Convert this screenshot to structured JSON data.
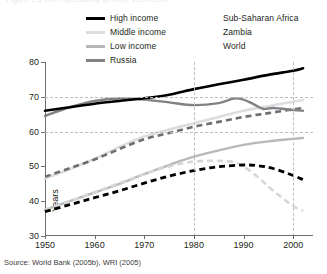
{
  "figure": {
    "top_fragment": "Figure 2.3  Life expectancy at birth, 1950-2002",
    "source_note": "Source: World Bank (2005b), WRI (2005)"
  },
  "legend": {
    "left_column": [
      {
        "label": "High income",
        "color": "#000000",
        "style": "solid",
        "width": 3
      },
      {
        "label": "Middle income",
        "color": "#dcdddf",
        "style": "solid",
        "width": 3
      },
      {
        "label": "Low income",
        "color": "#b6b8ba",
        "style": "solid",
        "width": 3
      },
      {
        "label": "Russia",
        "color": "#808285",
        "style": "solid",
        "width": 3
      }
    ],
    "right_column": [
      {
        "label": "Sub-Saharan Africa",
        "color": "#000000",
        "style": "dashed",
        "width": 3
      },
      {
        "label": "Zambia",
        "color": "#d5d6d8",
        "style": "dashed",
        "width": 3
      },
      {
        "label": "World",
        "color": "#6d6e71",
        "style": "dashed",
        "width": 3
      }
    ]
  },
  "chart_data": {
    "type": "line",
    "title": "",
    "xlabel": "",
    "ylabel": "Years",
    "xlim": [
      1950,
      2004
    ],
    "ylim": [
      30,
      80
    ],
    "xticks": [
      1950,
      1960,
      1970,
      1980,
      1990,
      2000
    ],
    "yticks": [
      30,
      40,
      50,
      60,
      70,
      80
    ],
    "xtick_labels": [
      "1950",
      "1960",
      "1970",
      "1980",
      "1990",
      "2000"
    ],
    "ytick_labels": [
      "30",
      "40",
      "50",
      "60",
      "70",
      "80"
    ],
    "grid": {
      "horizontal_at": [
        60,
        70
      ],
      "vertical_at": [
        1980,
        2000
      ],
      "style": "dashed"
    },
    "legend_position": "above-plot",
    "series": [
      {
        "name": "High income",
        "color": "#000000",
        "style": "solid",
        "width": 2.6,
        "x": [
          1950,
          1955,
          1960,
          1965,
          1970,
          1975,
          1980,
          1985,
          1990,
          1995,
          2000,
          2002
        ],
        "values": [
          66.0,
          67.0,
          68.0,
          68.8,
          69.6,
          70.6,
          72.2,
          73.6,
          74.9,
          76.3,
          77.5,
          78.2
        ]
      },
      {
        "name": "Russia",
        "color": "#808285",
        "style": "solid",
        "width": 2.4,
        "x": [
          1950,
          1955,
          1960,
          1965,
          1970,
          1975,
          1980,
          1985,
          1988,
          1990,
          1992,
          1994,
          1996,
          2000,
          2002
        ],
        "values": [
          64.5,
          67.0,
          68.8,
          69.5,
          69.2,
          68.4,
          67.6,
          68.2,
          69.5,
          69.2,
          67.9,
          66.5,
          66.8,
          66.2,
          66.0
        ]
      },
      {
        "name": "World",
        "color": "#6d6e71",
        "style": "dashed",
        "width": 2.6,
        "x": [
          1950,
          1955,
          1960,
          1965,
          1970,
          1975,
          1980,
          1985,
          1990,
          1995,
          2000,
          2002
        ],
        "values": [
          47.0,
          49.5,
          52.0,
          55.0,
          57.8,
          59.6,
          61.4,
          62.8,
          64.2,
          65.3,
          66.4,
          66.8
        ]
      },
      {
        "name": "Middle income",
        "color": "#dcdddf",
        "style": "solid",
        "width": 2.6,
        "x": [
          1950,
          1955,
          1960,
          1965,
          1970,
          1975,
          1980,
          1985,
          1990,
          1995,
          2000,
          2002
        ],
        "values": [
          46.5,
          49.2,
          52.2,
          55.6,
          58.6,
          60.6,
          62.4,
          64.2,
          66.0,
          67.3,
          68.6,
          69.1
        ]
      },
      {
        "name": "Low income",
        "color": "#b6b8ba",
        "style": "solid",
        "width": 2.4,
        "x": [
          1950,
          1955,
          1960,
          1965,
          1970,
          1975,
          1980,
          1985,
          1990,
          1995,
          2000,
          2002
        ],
        "values": [
          37.5,
          40.0,
          42.5,
          45.0,
          47.8,
          50.4,
          52.8,
          54.6,
          56.2,
          57.2,
          57.9,
          58.2
        ]
      },
      {
        "name": "Sub-Saharan Africa",
        "color": "#000000",
        "style": "dashed",
        "width": 2.8,
        "x": [
          1950,
          1955,
          1960,
          1965,
          1970,
          1975,
          1980,
          1985,
          1990,
          1993,
          1996,
          2000,
          2002
        ],
        "values": [
          37.0,
          39.0,
          41.0,
          43.0,
          45.2,
          47.2,
          48.8,
          49.9,
          50.4,
          50.2,
          49.4,
          47.4,
          46.2
        ]
      },
      {
        "name": "Zambia",
        "color": "#d5d6d8",
        "style": "dashed",
        "width": 2.6,
        "x": [
          1950,
          1955,
          1960,
          1965,
          1970,
          1975,
          1980,
          1985,
          1988,
          1990,
          1993,
          1996,
          2000,
          2002
        ],
        "values": [
          37.5,
          40.0,
          42.6,
          45.2,
          47.8,
          50.0,
          51.4,
          51.6,
          51.2,
          50.0,
          46.8,
          43.0,
          38.6,
          37.2
        ]
      }
    ]
  }
}
